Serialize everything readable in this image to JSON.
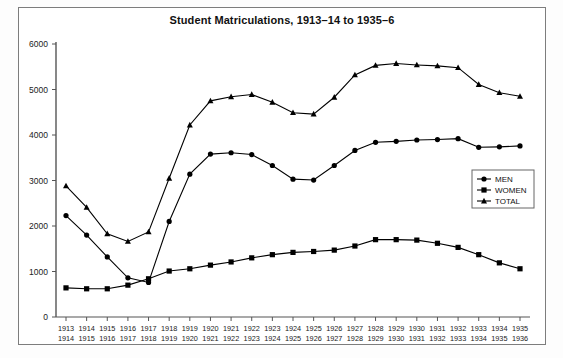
{
  "chart_data": {
    "type": "line",
    "title": "Student Matriculations, 1913–14 to 1935–6",
    "xlabel": "",
    "ylabel": "",
    "ylim": [
      0,
      6000
    ],
    "ytick_values": [
      0,
      1000,
      2000,
      3000,
      4000,
      5000,
      6000
    ],
    "ytick_labels": [
      "0",
      "1000",
      "2000",
      "3000",
      "4000",
      "5000",
      "6000"
    ],
    "grid": false,
    "legend_position": "right-middle",
    "categories": [
      "1913\n1914",
      "1914\n1915",
      "1915\n1916",
      "1916\n1917",
      "1917\n1918",
      "1918\n1919",
      "1919\n1920",
      "1920\n1921",
      "1921\n1922",
      "1922\n1923",
      "1923\n1924",
      "1924\n1925",
      "1925\n1926",
      "1926\n1927",
      "1927\n1928",
      "1928\n1929",
      "1929\n1930",
      "1930\n1931",
      "1931\n1932",
      "1932\n1933",
      "1933\n1934",
      "1934\n1935",
      "1935\n1936"
    ],
    "categories_top": [
      "1913",
      "1914",
      "1915",
      "1916",
      "1917",
      "1918",
      "1919",
      "1920",
      "1921",
      "1922",
      "1923",
      "1924",
      "1925",
      "1926",
      "1927",
      "1928",
      "1929",
      "1930",
      "1931",
      "1932",
      "1933",
      "1934",
      "1935"
    ],
    "categories_bottom": [
      "1914",
      "1915",
      "1916",
      "1917",
      "1918",
      "1919",
      "1920",
      "1921",
      "1922",
      "1923",
      "1924",
      "1925",
      "1926",
      "1927",
      "1928",
      "1929",
      "1930",
      "1931",
      "1932",
      "1933",
      "1934",
      "1935",
      "1936"
    ],
    "series": [
      {
        "name": "MEN",
        "marker": "circle",
        "color": "#000000",
        "values": [
          2230,
          1800,
          1320,
          860,
          760,
          2100,
          3140,
          3580,
          3610,
          3570,
          3330,
          3030,
          3010,
          3330,
          3660,
          3840,
          3860,
          3890,
          3900,
          3920,
          3730,
          3740,
          3760
        ]
      },
      {
        "name": "WOMEN",
        "marker": "square",
        "color": "#000000",
        "values": [
          640,
          620,
          620,
          700,
          840,
          1010,
          1060,
          1140,
          1210,
          1300,
          1370,
          1420,
          1440,
          1470,
          1560,
          1700,
          1700,
          1690,
          1620,
          1530,
          1370,
          1190,
          1060
        ]
      },
      {
        "name": "TOTAL",
        "marker": "triangle",
        "color": "#000000",
        "values": [
          2880,
          2410,
          1830,
          1660,
          1870,
          3050,
          4220,
          4750,
          4840,
          4890,
          4720,
          4490,
          4460,
          4830,
          5320,
          5530,
          5570,
          5540,
          5520,
          5480,
          5110,
          4930,
          4850
        ]
      }
    ]
  },
  "legend": {
    "items": [
      {
        "label": "MEN",
        "marker": "circle"
      },
      {
        "label": "WOMEN",
        "marker": "square"
      },
      {
        "label": "TOTAL",
        "marker": "triangle"
      }
    ]
  }
}
